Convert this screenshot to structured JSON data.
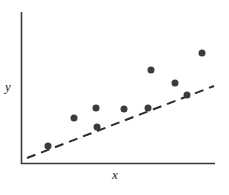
{
  "figure": {
    "background_color": "#ffffff",
    "width": 229,
    "height": 195
  },
  "labels": {
    "y_axis": "y",
    "x_axis": "x"
  },
  "chart_data": {
    "type": "scatter",
    "title": "",
    "subtitle": "",
    "xlabel": "x",
    "ylabel": "y",
    "xlim": [
      0,
      10
    ],
    "ylim": [
      0,
      10
    ],
    "grid": false,
    "legend": null,
    "axis_ticks": {
      "x": [],
      "y": []
    },
    "axes": {
      "style": "two-spine-open",
      "color": "#3a3a3a",
      "x_axis_pixels": {
        "x1": 21,
        "y1": 164,
        "x2": 215,
        "y2": 164
      },
      "y_axis_pixels": {
        "x1": 21,
        "y1": 12,
        "x2": 21,
        "y2": 164
      }
    },
    "series": [
      {
        "name": "observations",
        "type": "scatter",
        "marker": "filled-circle",
        "marker_color": "#3b3b3b",
        "marker_size_px": 7,
        "points_pixels": [
          {
            "x": 48,
            "y": 146
          },
          {
            "x": 74,
            "y": 118
          },
          {
            "x": 96,
            "y": 108
          },
          {
            "x": 97,
            "y": 127
          },
          {
            "x": 124,
            "y": 109
          },
          {
            "x": 148,
            "y": 108
          },
          {
            "x": 151,
            "y": 70
          },
          {
            "x": 175,
            "y": 83
          },
          {
            "x": 187,
            "y": 95
          },
          {
            "x": 202,
            "y": 53
          }
        ],
        "x": [
          1.4,
          2.7,
          3.9,
          3.9,
          5.3,
          6.5,
          6.7,
          7.9,
          8.6,
          9.3
        ],
        "y": [
          1.2,
          3.0,
          3.7,
          2.4,
          3.6,
          3.7,
          6.2,
          5.3,
          4.5,
          7.3
        ]
      },
      {
        "name": "fitted-line",
        "type": "line",
        "line_style": "dashed",
        "line_color": "#2b2b2b",
        "line_width_px": 2,
        "dash_pattern_px": [
          9,
          6
        ],
        "endpoints_pixels": {
          "x1": 27,
          "y1": 158,
          "x2": 214,
          "y2": 86
        },
        "x": [
          0.3,
          9.9
        ],
        "y": [
          0.4,
          5.1
        ]
      }
    ],
    "annotations": []
  },
  "colors": {
    "marker": "#3b3b3b",
    "line": "#2b2b2b",
    "axis": "#3a3a3a",
    "text": "#1a1a1a",
    "background": "#ffffff"
  }
}
